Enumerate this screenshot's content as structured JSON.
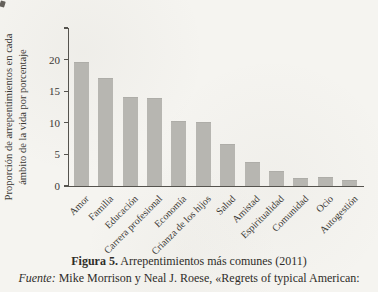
{
  "chart_data": {
    "type": "bar",
    "title": "",
    "categories": [
      "Amor",
      "Familia",
      "Educación",
      "Carrera profesional",
      "Economía",
      "Crianza de los hijos",
      "Salud",
      "Amistad",
      "Espiritualidad",
      "Comunidad",
      "Ocio",
      "Autogestión"
    ],
    "values": [
      19.5,
      17,
      14,
      13.7,
      10.1,
      10,
      6.5,
      3.7,
      2.2,
      1.1,
      1.2,
      0.8
    ],
    "ylabel_line1": "Proporción de arrepentimientos en cada",
    "ylabel_line2": "ámbito de la vida por porcentaje",
    "yticks": [
      {
        "value": 0,
        "label": "0"
      },
      {
        "value": 5,
        "label": "5"
      },
      {
        "value": 10,
        "label": "10"
      },
      {
        "value": 15,
        "label": "15"
      },
      {
        "value": 20,
        "label": "20"
      },
      {
        "value": 25,
        "label": ""
      }
    ],
    "ylim": [
      0,
      25
    ],
    "xlabel": "",
    "grid": false,
    "legend": null,
    "bar_color": "#b7b6b1",
    "axis_color": "#55534e"
  },
  "caption": {
    "figure_label": "Figura 5.",
    "figure_text": " Arrepentimientos más comunes (2011)",
    "source_label": "Fuente:",
    "source_text": " Mike Morrison y Neal J. Roese, «Regrets of typical American:"
  }
}
